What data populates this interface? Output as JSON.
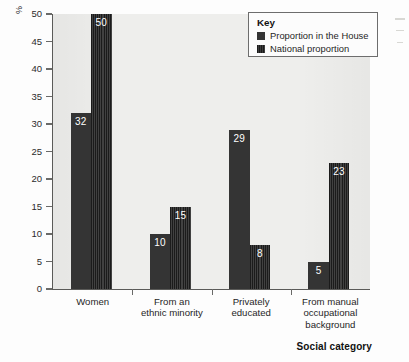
{
  "chart_data": {
    "type": "bar",
    "title": "",
    "subtitle": "",
    "xlabel": "Social category",
    "ylabel": "%",
    "ylim": [
      0,
      50
    ],
    "yticks": [
      0,
      5,
      10,
      15,
      20,
      25,
      30,
      35,
      40,
      45,
      50
    ],
    "grid": false,
    "legend_position": "top-right",
    "legend_title": "Key",
    "categories": [
      "Women",
      "From an ethnic minority",
      "Privately educated",
      "From manual occupational background"
    ],
    "category_lines": [
      [
        "Women"
      ],
      [
        "From an",
        "ethnic minority"
      ],
      [
        "Privately",
        "educated"
      ],
      [
        "From manual",
        "occupational",
        "background"
      ]
    ],
    "series": [
      {
        "name": "Proportion in the House",
        "values": [
          32,
          10,
          29,
          5
        ],
        "color": "#343434",
        "pattern": "solid"
      },
      {
        "name": "National proportion",
        "values": [
          50,
          15,
          8,
          23
        ],
        "color": "#1b1b1b",
        "pattern": "vertical-stripes"
      }
    ]
  },
  "axis": {
    "y_unit_label": "%",
    "x_title": "Social category"
  },
  "legend": {
    "title": "Key",
    "entries": [
      {
        "label": "Proportion in the House"
      },
      {
        "label": "National proportion"
      }
    ]
  },
  "colors": {
    "plot_background": "#eeeeec",
    "page_background": "#fdfdfd",
    "axis_line": "#5a5a58",
    "series_1": "#343434",
    "series_2": "#1b1b1b",
    "label_text": "#ffffff"
  }
}
